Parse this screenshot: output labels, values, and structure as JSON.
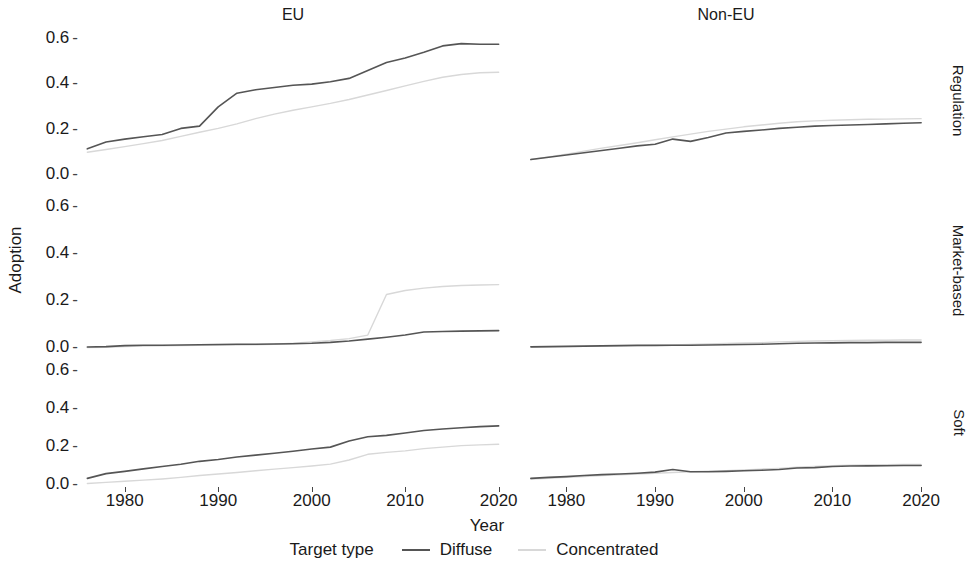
{
  "axes": {
    "ylabel": "Adoption",
    "xlabel": "Year"
  },
  "columns": [
    {
      "label": "EU"
    },
    {
      "label": "Non-EU"
    }
  ],
  "rows": [
    {
      "label": "Regulation"
    },
    {
      "label": "Market-based"
    },
    {
      "label": "Soft"
    }
  ],
  "legend": {
    "title": "Target type",
    "items": [
      {
        "label": "Diffuse",
        "color": "#555555"
      },
      {
        "label": "Concentrated",
        "color": "#d8d8d8"
      }
    ]
  },
  "ticks": {
    "y": [
      "0.6",
      "0.4",
      "0.2",
      "0.0"
    ],
    "x": [
      "1980",
      "1990",
      "2000",
      "2010",
      "2020"
    ]
  },
  "chart_data": {
    "type": "line",
    "title": "",
    "xlabel": "Year",
    "ylabel": "Adoption",
    "xlim": [
      1975,
      2021
    ],
    "ylim": [
      0.0,
      0.66
    ],
    "grid": false,
    "legend_position": "bottom",
    "facet_cols": [
      "EU",
      "Non-EU"
    ],
    "facet_rows": [
      "Regulation",
      "Market-based",
      "Soft"
    ],
    "x": [
      1976,
      1978,
      1980,
      1982,
      1984,
      1986,
      1988,
      1990,
      1992,
      1994,
      1996,
      1998,
      2000,
      2002,
      2004,
      2006,
      2008,
      2010,
      2012,
      2014,
      2016,
      2018,
      2020
    ],
    "panels": [
      {
        "row": "Regulation",
        "col": "EU",
        "series": [
          {
            "name": "Diffuse",
            "color": "#555555",
            "values": [
              0.115,
              0.145,
              0.158,
              0.168,
              0.178,
              0.205,
              0.215,
              0.3,
              0.36,
              0.375,
              0.385,
              0.395,
              0.4,
              0.41,
              0.425,
              0.46,
              0.495,
              0.515,
              0.54,
              0.568,
              0.578,
              0.575,
              0.575
            ]
          },
          {
            "name": "Concentrated",
            "color": "#d8d8d8",
            "values": [
              0.1,
              0.112,
              0.125,
              0.138,
              0.152,
              0.17,
              0.188,
              0.205,
              0.225,
              0.248,
              0.268,
              0.285,
              0.3,
              0.315,
              0.332,
              0.352,
              0.372,
              0.392,
              0.412,
              0.43,
              0.442,
              0.45,
              0.452
            ]
          }
        ]
      },
      {
        "row": "Regulation",
        "col": "Non-EU",
        "series": [
          {
            "name": "Diffuse",
            "color": "#555555",
            "values": [
              0.068,
              0.078,
              0.088,
              0.098,
              0.108,
              0.118,
              0.128,
              0.135,
              0.158,
              0.148,
              0.165,
              0.185,
              0.192,
              0.198,
              0.205,
              0.21,
              0.215,
              0.218,
              0.22,
              0.222,
              0.225,
              0.228,
              0.23
            ]
          },
          {
            "name": "Concentrated",
            "color": "#d8d8d8",
            "values": [
              0.068,
              0.08,
              0.092,
              0.105,
              0.118,
              0.13,
              0.142,
              0.155,
              0.168,
              0.18,
              0.192,
              0.202,
              0.212,
              0.22,
              0.228,
              0.234,
              0.238,
              0.241,
              0.243,
              0.245,
              0.246,
              0.247,
              0.248
            ]
          }
        ]
      },
      {
        "row": "Market-based",
        "col": "EU",
        "series": [
          {
            "name": "Diffuse",
            "color": "#555555",
            "values": [
              0.004,
              0.006,
              0.01,
              0.012,
              0.012,
              0.013,
              0.014,
              0.015,
              0.016,
              0.016,
              0.017,
              0.018,
              0.02,
              0.024,
              0.03,
              0.038,
              0.046,
              0.055,
              0.068,
              0.07,
              0.072,
              0.073,
              0.074
            ]
          },
          {
            "name": "Concentrated",
            "color": "#d8d8d8",
            "values": [
              0.002,
              0.003,
              0.006,
              0.008,
              0.009,
              0.01,
              0.011,
              0.012,
              0.013,
              0.014,
              0.016,
              0.02,
              0.026,
              0.032,
              0.04,
              0.055,
              0.228,
              0.245,
              0.255,
              0.262,
              0.266,
              0.268,
              0.27
            ]
          }
        ]
      },
      {
        "row": "Market-based",
        "col": "Non-EU",
        "series": [
          {
            "name": "Diffuse",
            "color": "#555555",
            "values": [
              0.005,
              0.006,
              0.007,
              0.008,
              0.009,
              0.01,
              0.011,
              0.011,
              0.012,
              0.012,
              0.013,
              0.014,
              0.015,
              0.016,
              0.018,
              0.02,
              0.021,
              0.022,
              0.023,
              0.023,
              0.024,
              0.024,
              0.024
            ]
          },
          {
            "name": "Concentrated",
            "color": "#d8d8d8",
            "values": [
              0.004,
              0.005,
              0.006,
              0.007,
              0.008,
              0.009,
              0.01,
              0.011,
              0.013,
              0.015,
              0.017,
              0.019,
              0.021,
              0.023,
              0.026,
              0.028,
              0.03,
              0.031,
              0.032,
              0.033,
              0.033,
              0.034,
              0.034
            ]
          }
        ]
      },
      {
        "row": "Soft",
        "col": "EU",
        "series": [
          {
            "name": "Diffuse",
            "color": "#555555",
            "values": [
              0.035,
              0.06,
              0.072,
              0.085,
              0.098,
              0.11,
              0.125,
              0.135,
              0.148,
              0.158,
              0.168,
              0.178,
              0.19,
              0.2,
              0.232,
              0.255,
              0.262,
              0.275,
              0.288,
              0.296,
              0.302,
              0.308,
              0.312
            ]
          },
          {
            "name": "Concentrated",
            "color": "#d8d8d8",
            "values": [
              0.008,
              0.014,
              0.02,
              0.026,
              0.032,
              0.04,
              0.05,
              0.058,
              0.066,
              0.075,
              0.084,
              0.092,
              0.1,
              0.11,
              0.132,
              0.162,
              0.172,
              0.18,
              0.192,
              0.2,
              0.208,
              0.212,
              0.215
            ]
          }
        ]
      },
      {
        "row": "Soft",
        "col": "Non-EU",
        "series": [
          {
            "name": "Diffuse",
            "color": "#555555",
            "values": [
              0.035,
              0.04,
              0.044,
              0.05,
              0.055,
              0.058,
              0.062,
              0.068,
              0.082,
              0.07,
              0.07,
              0.072,
              0.075,
              0.078,
              0.082,
              0.09,
              0.092,
              0.098,
              0.1,
              0.101,
              0.102,
              0.103,
              0.103
            ]
          },
          {
            "name": "Concentrated",
            "color": "#d8d8d8",
            "values": [
              0.032,
              0.036,
              0.04,
              0.045,
              0.05,
              0.054,
              0.058,
              0.062,
              0.066,
              0.07,
              0.073,
              0.076,
              0.08,
              0.084,
              0.088,
              0.094,
              0.098,
              0.102,
              0.104,
              0.106,
              0.107,
              0.108,
              0.108
            ]
          }
        ]
      }
    ]
  }
}
